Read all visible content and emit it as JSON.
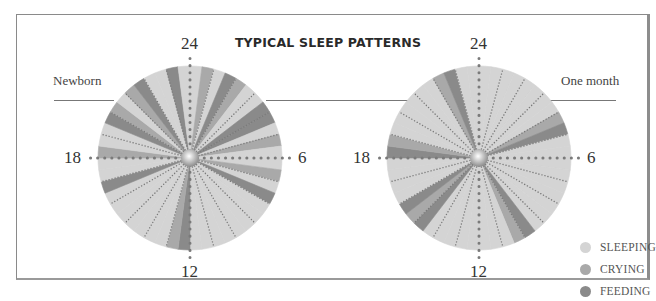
{
  "title": "TYPICAL SLEEP PATTERNS",
  "colors": {
    "sleeping": "#d4d4d4",
    "crying": "#a9a9a9",
    "feeding": "#8a8a8a",
    "divider": "#7a7a7a"
  },
  "legend": [
    {
      "key": "sleeping",
      "label": "SLEEPING",
      "color": "#d4d4d4"
    },
    {
      "key": "crying",
      "label": "CRYING",
      "color": "#a9a9a9"
    },
    {
      "key": "feeding",
      "label": "FEEDING",
      "color": "#8a8a8a"
    }
  ],
  "clock_labels": {
    "top": "24",
    "right": "6",
    "bottom": "12",
    "left": "18"
  },
  "charts": {
    "newborn": {
      "label": "Newborn"
    },
    "one_month": {
      "label": "One month"
    }
  },
  "chart_data": [
    {
      "type": "pie",
      "title": "Newborn",
      "subtitle": "Typical sleep patterns over a 24-hour clock (24 at top, clockwise)",
      "unit": "half-hour slots (48 per day)",
      "legend": [
        "SLEEPING",
        "CRYING",
        "FEEDING"
      ],
      "slots": [
        "S",
        "C",
        "S",
        "F",
        "C",
        "S",
        "S",
        "F",
        "F",
        "S",
        "C",
        "S",
        "S",
        "C",
        "S",
        "F",
        "S",
        "S",
        "S",
        "S",
        "S",
        "S",
        "S",
        "S",
        "F",
        "C",
        "S",
        "S",
        "S",
        "S",
        "S",
        "S",
        "S",
        "F",
        "S",
        "S",
        "C",
        "S",
        "S",
        "F",
        "C",
        "S",
        "C",
        "F",
        "S",
        "S",
        "F",
        "S"
      ]
    },
    {
      "type": "pie",
      "title": "One month",
      "subtitle": "Typical sleep patterns over a 24-hour clock (24 at top, clockwise)",
      "unit": "half-hour slots (48 per day)",
      "legend": [
        "SLEEPING",
        "CRYING",
        "FEEDING"
      ],
      "slots": [
        "S",
        "S",
        "S",
        "S",
        "S",
        "S",
        "S",
        "S",
        "C",
        "F",
        "S",
        "S",
        "S",
        "S",
        "S",
        "S",
        "S",
        "S",
        "S",
        "F",
        "C",
        "S",
        "S",
        "S",
        "S",
        "S",
        "S",
        "S",
        "S",
        "F",
        "C",
        "F",
        "S",
        "S",
        "S",
        "S",
        "F",
        "C",
        "S",
        "S",
        "S",
        "S",
        "S",
        "S",
        "C",
        "F",
        "S",
        "S"
      ]
    }
  ]
}
